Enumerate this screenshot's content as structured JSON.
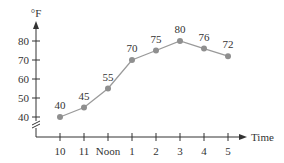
{
  "chart_data": {
    "type": "line",
    "title": "",
    "xlabel": "Time",
    "ylabel": "°F",
    "categories": [
      "10",
      "11",
      "Noon",
      "1",
      "2",
      "3",
      "4",
      "5"
    ],
    "values": [
      40,
      45,
      55,
      70,
      75,
      80,
      76,
      72
    ],
    "yticks": [
      40,
      50,
      60,
      70,
      80
    ],
    "ylim": [
      40,
      80
    ],
    "y_axis_break": true,
    "grid": false,
    "legend": null
  },
  "colors": {
    "line": "#9a9a9a",
    "marker": "#8f8f8f",
    "axis": "#333333",
    "text": "#333333"
  }
}
